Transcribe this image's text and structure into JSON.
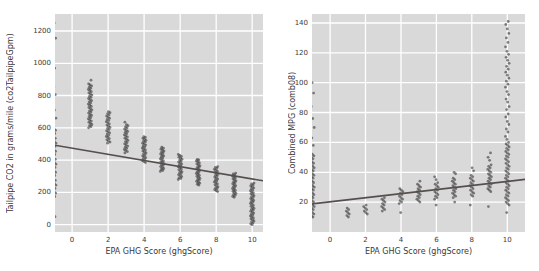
{
  "colors": {
    "page_bg": "#ffffff",
    "plot_bg": "#d9d9d9",
    "grid": "#ffffff",
    "point": "#262626",
    "line": "#554f4d",
    "text": "#3a3a3a"
  },
  "chart_data": [
    {
      "type": "scatter",
      "title": "",
      "xlabel": "EPA GHG Score (ghgScore)",
      "ylabel": "Tailpipe CO2 in grams/mile (co2TailpipeGpm)",
      "xlim": [
        -0.95,
        10.6
      ],
      "ylim": [
        -45,
        1305
      ],
      "xticks": [
        0,
        2,
        4,
        6,
        8,
        10
      ],
      "yticks": [
        0,
        200,
        400,
        600,
        800,
        1000,
        1200
      ],
      "grid": true,
      "style": "darkgrid",
      "legend": false,
      "regression_line": {
        "x1": -0.95,
        "y1": 492,
        "x2": 10.6,
        "y2": 272
      },
      "series": [
        {
          "name": "vehicles",
          "columns": [
            {
              "x": -1,
              "y": [
                175,
                185,
                195,
                205,
                215,
                225,
                235,
                245,
                255,
                265,
                275,
                285,
                295,
                305,
                315,
                325,
                335,
                345,
                355,
                365,
                375,
                385,
                395,
                405,
                415,
                425,
                435,
                445,
                455,
                465,
                475,
                485,
                495,
                505,
                515,
                525,
                535,
                545,
                555,
                565,
                575,
                585,
                595,
                605,
                50,
                110,
                660,
                710,
                755,
                805,
                855,
                905,
                970,
                1065,
                1155,
                1250
              ]
            },
            {
              "x": 1,
              "y": [
                600,
                607,
                614,
                621,
                628,
                635,
                642,
                649,
                656,
                663,
                670,
                677,
                684,
                691,
                698,
                705,
                712,
                719,
                726,
                733,
                740,
                747,
                754,
                761,
                768,
                775,
                782,
                789,
                796,
                803,
                810,
                817,
                824,
                831,
                838,
                845,
                852,
                859,
                866,
                873,
                895
              ]
            },
            {
              "x": 2,
              "y": [
                505,
                512,
                519,
                526,
                533,
                540,
                547,
                554,
                561,
                568,
                575,
                582,
                589,
                596,
                603,
                610,
                617,
                624,
                631,
                638,
                645,
                652,
                659,
                666,
                673,
                680,
                687,
                694,
                700
              ]
            },
            {
              "x": 3,
              "y": [
                445,
                452,
                459,
                466,
                473,
                480,
                487,
                494,
                501,
                508,
                515,
                522,
                529,
                536,
                543,
                550,
                557,
                564,
                571,
                578,
                585,
                592,
                599,
                606,
                613,
                620,
                635
              ]
            },
            {
              "x": 4,
              "y": [
                385,
                391,
                397,
                403,
                409,
                415,
                421,
                427,
                433,
                439,
                445,
                451,
                457,
                463,
                469,
                475,
                481,
                487,
                493,
                499,
                505,
                511,
                517,
                523,
                529,
                535,
                541,
                545
              ]
            },
            {
              "x": 5,
              "y": [
                330,
                336,
                342,
                348,
                354,
                360,
                366,
                372,
                378,
                384,
                390,
                396,
                402,
                408,
                414,
                420,
                426,
                432,
                438,
                444,
                450,
                456,
                462,
                468,
                474,
                480
              ]
            },
            {
              "x": 6,
              "y": [
                280,
                286,
                292,
                298,
                304,
                310,
                316,
                322,
                328,
                334,
                340,
                346,
                352,
                358,
                364,
                370,
                376,
                382,
                388,
                394,
                400,
                406,
                412,
                418,
                424,
                430,
                435
              ]
            },
            {
              "x": 7,
              "y": [
                245,
                251,
                257,
                263,
                269,
                275,
                281,
                287,
                293,
                299,
                305,
                311,
                317,
                323,
                329,
                335,
                341,
                347,
                353,
                359,
                365,
                371,
                377,
                383,
                389,
                395,
                401,
                405
              ]
            },
            {
              "x": 8,
              "y": [
                205,
                211,
                217,
                223,
                229,
                235,
                241,
                247,
                253,
                259,
                265,
                271,
                277,
                283,
                289,
                295,
                301,
                307,
                313,
                319,
                325,
                331,
                337,
                343,
                349,
                355,
                360
              ]
            },
            {
              "x": 9,
              "y": [
                170,
                176,
                182,
                188,
                194,
                200,
                206,
                212,
                218,
                224,
                230,
                236,
                242,
                248,
                254,
                260,
                266,
                272,
                278,
                284,
                290,
                296,
                302,
                308,
                314,
                320
              ]
            },
            {
              "x": 10,
              "y": [
                0,
                6,
                12,
                18,
                24,
                30,
                36,
                42,
                48,
                54,
                60,
                66,
                72,
                78,
                84,
                90,
                96,
                102,
                108,
                114,
                120,
                126,
                132,
                138,
                144,
                150,
                156,
                162,
                168,
                174,
                180,
                186,
                192,
                198,
                204,
                210,
                216,
                222,
                228,
                234,
                240,
                246,
                252,
                258
              ]
            }
          ]
        }
      ]
    },
    {
      "type": "scatter",
      "title": "",
      "xlabel": "EPA GHG Score (ghgScore)",
      "ylabel": "Combined MPG (comb08)",
      "xlim": [
        -1.02,
        11.0
      ],
      "ylim": [
        0,
        146
      ],
      "xticks": [
        0,
        2,
        4,
        6,
        8,
        10
      ],
      "yticks": [
        20,
        40,
        60,
        80,
        100,
        120,
        140
      ],
      "grid": true,
      "style": "darkgrid",
      "legend": false,
      "regression_line": {
        "x1": -1.02,
        "y1": 18.8,
        "x2": 11.0,
        "y2": 35.2
      },
      "series": [
        {
          "name": "vehicles",
          "columns": [
            {
              "x": -1,
              "y": [
                10,
                11,
                12,
                13,
                14,
                15,
                16,
                17,
                18,
                19,
                20,
                21,
                22,
                23,
                24,
                25,
                26,
                27,
                28,
                29,
                30,
                31,
                32,
                33,
                34,
                35,
                36,
                37,
                38,
                39,
                40,
                41,
                42,
                43,
                44,
                45,
                46,
                47,
                48,
                49,
                50,
                51,
                52,
                53,
                58,
                63,
                70,
                76,
                84,
                93,
                100,
                107
              ]
            },
            {
              "x": 1,
              "y": [
                10,
                11,
                12,
                13,
                14,
                15,
                16
              ]
            },
            {
              "x": 2,
              "y": [
                12,
                13,
                14,
                15,
                16,
                17,
                18
              ]
            },
            {
              "x": 3,
              "y": [
                14,
                15,
                16,
                17,
                18,
                19,
                20,
                21,
                22,
                23
              ]
            },
            {
              "x": 4,
              "y": [
                13,
                19,
                20,
                21,
                22,
                23,
                24,
                25,
                26,
                27,
                28,
                29
              ]
            },
            {
              "x": 5,
              "y": [
                20,
                21,
                22,
                23,
                24,
                25,
                26,
                27,
                28,
                29,
                30,
                31,
                32,
                34
              ]
            },
            {
              "x": 6,
              "y": [
                18,
                22,
                23,
                24,
                25,
                26,
                27,
                28,
                29,
                30,
                31,
                32,
                33,
                35,
                37
              ]
            },
            {
              "x": 7,
              "y": [
                20,
                23,
                24,
                25,
                26,
                27,
                28,
                29,
                30,
                31,
                32,
                33,
                34,
                35,
                36,
                39,
                40
              ]
            },
            {
              "x": 8,
              "y": [
                18,
                24,
                25,
                26,
                27,
                28,
                29,
                30,
                31,
                32,
                33,
                34,
                35,
                36,
                37,
                38,
                41,
                43
              ]
            },
            {
              "x": 9,
              "y": [
                17,
                27,
                28,
                29,
                30,
                31,
                32,
                33,
                34,
                35,
                36,
                37,
                38,
                39,
                40,
                41,
                42,
                43,
                44,
                45,
                48,
                50,
                53
              ]
            },
            {
              "x": 10,
              "y": [
                13,
                18,
                19,
                20,
                21,
                22,
                23,
                24,
                25,
                26,
                27,
                28,
                29,
                30,
                31,
                32,
                33,
                34,
                35,
                36,
                37,
                38,
                39,
                40,
                41,
                42,
                43,
                44,
                45,
                46,
                47,
                48,
                49,
                50,
                51,
                52,
                53,
                54,
                55,
                56,
                57,
                58,
                59,
                60,
                62,
                64,
                67,
                69,
                72,
                74,
                77,
                79,
                82,
                84,
                87,
                89,
                92,
                94,
                97,
                99,
                101,
                103,
                105,
                107,
                109,
                111,
                113,
                115,
                117,
                119,
                121,
                124,
                127,
                130,
                133,
                136,
                139,
                141
              ]
            }
          ]
        }
      ]
    }
  ]
}
